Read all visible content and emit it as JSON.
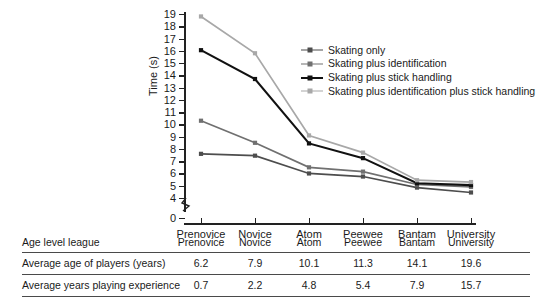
{
  "chart_data": {
    "type": "line",
    "title": "",
    "xlabel": "",
    "ylabel": "Time (s)",
    "categories": [
      "Prenovice",
      "Novice",
      "Atom",
      "Peewee",
      "Bantam",
      "University"
    ],
    "yticks": [
      19,
      18,
      17,
      16,
      15,
      14,
      13,
      12,
      11,
      10,
      9,
      8,
      7,
      6,
      5,
      4,
      0
    ],
    "ylim": [
      4,
      19
    ],
    "axis_break": true,
    "axis_break_note": "0",
    "grid": false,
    "legend_position": "upper-right-inside",
    "series": [
      {
        "name": "Skating only",
        "color": "#4d4d4d",
        "values": [
          7.6,
          7.45,
          6.0,
          5.75,
          4.85,
          4.45
        ]
      },
      {
        "name": "Skating plus identification",
        "color": "#707070",
        "values": [
          10.3,
          8.5,
          6.5,
          6.15,
          5.1,
          4.9
        ]
      },
      {
        "name": "Skating plus stick handling",
        "color": "#111111",
        "values": [
          16.05,
          13.7,
          8.45,
          7.25,
          5.2,
          5.05
        ]
      },
      {
        "name": "Skating plus identification plus stick handling",
        "color": "#a8a8a8",
        "values": [
          18.8,
          15.8,
          9.1,
          7.7,
          5.45,
          5.3
        ]
      }
    ]
  },
  "table": {
    "columns": [
      "Prenovice",
      "Novice",
      "Atom",
      "Peewee",
      "Bantam",
      "University"
    ],
    "rows": [
      {
        "label": "Age level league",
        "values": [
          "Prenovice",
          "Novice",
          "Atom",
          "Peewee",
          "Bantam",
          "University"
        ]
      },
      {
        "label": "Average age of players (years)",
        "values": [
          "6.2",
          "7.9",
          "10.1",
          "11.3",
          "14.1",
          "19.6"
        ]
      },
      {
        "label": "Average years playing experience",
        "values": [
          "0.7",
          "2.2",
          "4.8",
          "5.4",
          "7.9",
          "15.7"
        ]
      }
    ]
  },
  "caption": {
    "text": ""
  }
}
